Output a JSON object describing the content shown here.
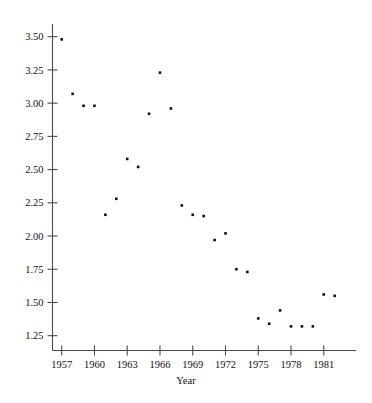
{
  "chart_data": {
    "type": "scatter",
    "title": "",
    "xlabel": "Year",
    "ylabel": "",
    "xlim": [
      1955.6,
      1983.4
    ],
    "ylim": [
      1.16,
      3.62
    ],
    "grid": false,
    "legend": null,
    "xticks": [
      1957,
      1960,
      1963,
      1966,
      1969,
      1972,
      1975,
      1978,
      1981
    ],
    "xtick_labels": [
      "1957",
      "1960",
      "1963",
      "1966",
      "1969",
      "1972",
      "1975",
      "1978",
      "1981"
    ],
    "yticks": [
      1.25,
      1.5,
      1.75,
      2.0,
      2.25,
      2.5,
      2.75,
      3.0,
      3.25,
      3.5
    ],
    "ytick_labels": [
      "1.25",
      "1.50",
      "1.75",
      "2.00",
      "2.25",
      "2.50",
      "2.75",
      "3.00",
      "3.25",
      "3.50"
    ],
    "marker": "square",
    "marker_color": "#111111",
    "marker_size": 2.6,
    "series": [
      {
        "name": "series-1",
        "x": [
          1957.0,
          1958.0,
          1959.0,
          1960.0,
          1961.0,
          1962.0,
          1963.0,
          1964.0,
          1965.0,
          1966.0,
          1967.0,
          1968.0,
          1969.0,
          1970.0,
          1971.0,
          1972.0,
          1973.0,
          1974.0,
          1975.0,
          1976.0,
          1977.0,
          1978.0,
          1979.0,
          1980.0,
          1981.0,
          1982.0
        ],
        "y": [
          3.48,
          3.07,
          2.98,
          2.98,
          2.16,
          2.28,
          2.58,
          2.52,
          2.92,
          3.23,
          2.96,
          2.23,
          2.16,
          2.15,
          1.97,
          2.02,
          1.75,
          1.73,
          1.38,
          1.34,
          1.44,
          1.32,
          1.32,
          1.32,
          1.56,
          1.55
        ]
      }
    ],
    "points": [
      {
        "year": 1957,
        "value": 3.48
      },
      {
        "year": 1958,
        "value": 3.07
      },
      {
        "year": 1959,
        "value": 2.98
      },
      {
        "year": 1960,
        "value": 2.98
      },
      {
        "year": 1961,
        "value": 2.16
      },
      {
        "year": 1962,
        "value": 2.28
      },
      {
        "year": 1963,
        "value": 2.58
      },
      {
        "year": 1964,
        "value": 2.52
      },
      {
        "year": 1965,
        "value": 2.92
      },
      {
        "year": 1966,
        "value": 3.23
      },
      {
        "year": 1967,
        "value": 2.96
      },
      {
        "year": 1968,
        "value": 2.23
      },
      {
        "year": 1969,
        "value": 2.16
      },
      {
        "year": 1970,
        "value": 2.15
      },
      {
        "year": 1971,
        "value": 1.97
      },
      {
        "year": 1972,
        "value": 2.02
      },
      {
        "year": 1973,
        "value": 1.75
      },
      {
        "year": 1974,
        "value": 1.73
      },
      {
        "year": 1975,
        "value": 1.38
      },
      {
        "year": 1976,
        "value": 1.34
      },
      {
        "year": 1977,
        "value": 1.44
      },
      {
        "year": 1978,
        "value": 1.32
      },
      {
        "year": 1979,
        "value": 1.32
      },
      {
        "year": 1980,
        "value": 1.32
      },
      {
        "year": 1981,
        "value": 1.56
      },
      {
        "year": 1982,
        "value": 1.55
      }
    ],
    "axis_colors": {
      "spine": "#4a4a4a",
      "text": "#111111",
      "background": "#ffffff"
    }
  }
}
